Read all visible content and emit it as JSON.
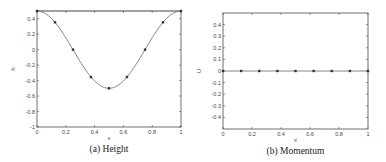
{
  "chart_data": [
    {
      "type": "line",
      "title": "",
      "caption": "(a) Height",
      "xlabel": "x",
      "ylabel": "h",
      "xlim": [
        0,
        1
      ],
      "ylim": [
        -1,
        0.5
      ],
      "xticks": [
        "0",
        "0.2",
        "0.4",
        "0.6",
        "0.8",
        "1"
      ],
      "yticks": [
        "-1",
        "-0.8",
        "-0.6",
        "-0.4",
        "-0.2",
        "0",
        "0.2",
        "0.4"
      ],
      "grid": false,
      "series": [
        {
          "name": "h",
          "x": [
            0,
            0.125,
            0.25,
            0.375,
            0.5,
            0.625,
            0.75,
            0.875,
            1
          ],
          "values": [
            0.5,
            0.354,
            0,
            -0.354,
            -0.5,
            -0.354,
            0,
            0.354,
            0.5
          ],
          "markers": true,
          "curve": "0.5*cos(2*pi*x)"
        }
      ]
    },
    {
      "type": "line",
      "title": "",
      "caption": "(b) Momentum",
      "xlabel": "x",
      "ylabel": "U",
      "xlim": [
        0,
        1
      ],
      "ylim": [
        -0.5,
        0.5
      ],
      "xticks": [
        "0",
        "0.2",
        "0.4",
        "0.6",
        "0.8",
        "1"
      ],
      "yticks": [
        "-0.4",
        "-0.3",
        "-0.2",
        "-0.1",
        "0",
        "0.1",
        "0.2",
        "0.3",
        "0.4"
      ],
      "grid": false,
      "series": [
        {
          "name": "U",
          "x": [
            0,
            0.125,
            0.25,
            0.375,
            0.5,
            0.625,
            0.75,
            0.875,
            1
          ],
          "values": [
            0,
            0,
            0,
            0,
            0,
            0,
            0,
            0,
            0
          ],
          "markers": true
        }
      ]
    }
  ],
  "colors": {
    "line": "#777777",
    "marker": "#333333",
    "axis": "#333333"
  }
}
